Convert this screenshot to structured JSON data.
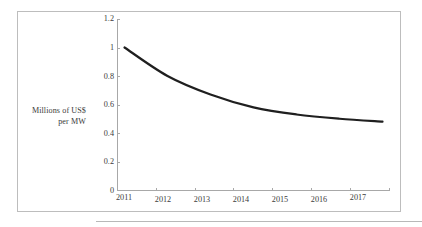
{
  "figure": {
    "frame_border_color": "#bdbdbd",
    "background_color": "#ffffff",
    "bottom_rule_color": "#b8b8b8"
  },
  "axis_title": {
    "line1": "Millions of US$",
    "line2": "per MW"
  },
  "chart_data": {
    "type": "line",
    "title": "",
    "subtitle": "",
    "xlabel": "",
    "ylabel": "Millions of US$ per MW",
    "categories": [
      "2011",
      "2012",
      "2013",
      "2014",
      "2015",
      "2016",
      "2017"
    ],
    "x": [
      2011,
      2012,
      2013,
      2014,
      2015,
      2016,
      2017
    ],
    "values": [
      1.0,
      0.8,
      0.67,
      0.58,
      0.53,
      0.5,
      0.48
    ],
    "series": [
      {
        "name": "Cost per MW",
        "values": [
          1.0,
          0.8,
          0.67,
          0.58,
          0.53,
          0.5,
          0.48
        ],
        "color": "#1f1f1f",
        "line_width": 2.2,
        "smooth": true,
        "markers": false
      }
    ],
    "ylim": [
      0,
      1.2
    ],
    "ytick_values": [
      0,
      0.2,
      0.4,
      0.6,
      0.8,
      1,
      1.2
    ],
    "ytick_labels": [
      "0",
      "0.2",
      "0.4",
      "0.6",
      "0.8",
      "1",
      "1.2"
    ],
    "xtick_labels": [
      "2011",
      "2012",
      "2013",
      "2014",
      "2015",
      "2016",
      "2017"
    ],
    "grid": false,
    "legend": false,
    "legend_position": "none",
    "annotations": []
  }
}
